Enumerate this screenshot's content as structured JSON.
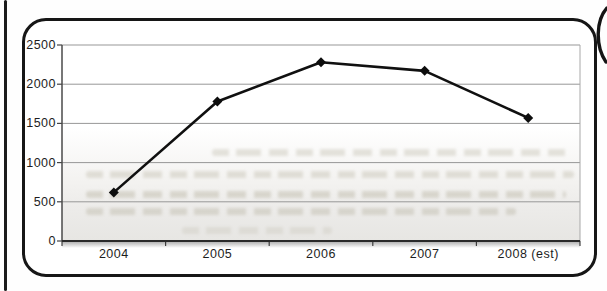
{
  "chart_data": {
    "type": "line",
    "title": "",
    "xlabel": "",
    "ylabel": "",
    "categories": [
      "2004",
      "2005",
      "2006",
      "2007",
      "2008 (est)"
    ],
    "values": [
      620,
      1780,
      2280,
      2170,
      1570
    ],
    "ylim": [
      0,
      2500
    ],
    "yticks": [
      0,
      500,
      1000,
      1500,
      2000,
      2500
    ],
    "grid": true,
    "legend_position": "none",
    "marker_style": "diamond",
    "line_color": "#101010",
    "marker_color": "#0d0d0d",
    "gridline_color": "#979797",
    "axis_color": "#2a2a2a",
    "frame_color": "#161616",
    "plot_background_top": "#ffffff",
    "plot_background_bottom": "#e7e6e3"
  }
}
